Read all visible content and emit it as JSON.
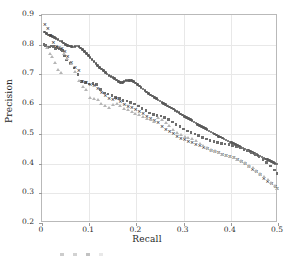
{
  "chart_data": {
    "type": "scatter",
    "title": "",
    "xlabel": "Recall",
    "ylabel": "Precision",
    "xlim": [
      0,
      0.5
    ],
    "ylim": [
      0.2,
      0.9
    ],
    "grid": true,
    "legend_position": "bottom",
    "xticks": [
      "0",
      "0.1",
      "0.2",
      "0.3",
      "0.4",
      "0.5"
    ],
    "xtick_values": [
      0,
      0.1,
      0.2,
      0.3,
      0.4,
      0.5
    ],
    "yticks": [
      "0.2",
      "0.3",
      "0.4",
      "0.5",
      "0.6",
      "0.7",
      "0.8",
      "0.9"
    ],
    "ytick_values": [
      0.2,
      0.3,
      0.4,
      0.5,
      0.6,
      0.7,
      0.8,
      0.9
    ],
    "series": [
      {
        "name": "series-1-dark-line",
        "marker": "circle",
        "color": "#595959",
        "size": 2.6,
        "x": [
          0.005,
          0.01,
          0.014,
          0.018,
          0.022,
          0.026,
          0.03,
          0.034,
          0.038,
          0.042,
          0.046,
          0.05,
          0.054,
          0.058,
          0.062,
          0.066,
          0.07,
          0.074,
          0.078,
          0.082,
          0.086,
          0.09,
          0.094,
          0.098,
          0.102,
          0.106,
          0.11,
          0.114,
          0.118,
          0.122,
          0.126,
          0.13,
          0.134,
          0.138,
          0.142,
          0.146,
          0.15,
          0.154,
          0.158,
          0.162,
          0.166,
          0.17,
          0.174,
          0.178,
          0.182,
          0.186,
          0.19,
          0.194,
          0.198,
          0.202,
          0.206,
          0.21,
          0.214,
          0.218,
          0.222,
          0.226,
          0.23,
          0.234,
          0.238,
          0.242,
          0.246,
          0.25,
          0.254,
          0.258,
          0.262,
          0.266,
          0.27,
          0.274,
          0.278,
          0.282,
          0.286,
          0.29,
          0.294,
          0.298,
          0.302,
          0.306,
          0.31,
          0.314,
          0.318,
          0.322,
          0.326,
          0.33,
          0.334,
          0.338,
          0.342,
          0.346,
          0.35,
          0.354,
          0.358,
          0.362,
          0.366,
          0.37,
          0.374,
          0.378,
          0.382,
          0.386,
          0.39,
          0.394,
          0.398,
          0.402,
          0.406,
          0.41,
          0.414,
          0.418,
          0.422,
          0.426,
          0.43,
          0.434,
          0.438,
          0.442,
          0.446,
          0.45,
          0.454,
          0.458,
          0.462,
          0.466,
          0.47,
          0.474,
          0.478,
          0.482,
          0.486,
          0.49,
          0.494,
          0.498
        ],
        "y": [
          0.843,
          0.838,
          0.833,
          0.831,
          0.828,
          0.824,
          0.82,
          0.818,
          0.813,
          0.81,
          0.806,
          0.801,
          0.797,
          0.795,
          0.793,
          0.792,
          0.794,
          0.796,
          0.793,
          0.789,
          0.783,
          0.777,
          0.77,
          0.763,
          0.757,
          0.751,
          0.744,
          0.737,
          0.73,
          0.724,
          0.718,
          0.713,
          0.707,
          0.702,
          0.697,
          0.693,
          0.69,
          0.687,
          0.681,
          0.676,
          0.672,
          0.673,
          0.676,
          0.679,
          0.68,
          0.68,
          0.679,
          0.676,
          0.671,
          0.666,
          0.661,
          0.656,
          0.651,
          0.646,
          0.641,
          0.636,
          0.631,
          0.627,
          0.623,
          0.619,
          0.614,
          0.61,
          0.606,
          0.602,
          0.598,
          0.594,
          0.59,
          0.587,
          0.583,
          0.579,
          0.575,
          0.571,
          0.567,
          0.563,
          0.559,
          0.555,
          0.551,
          0.548,
          0.544,
          0.54,
          0.536,
          0.532,
          0.529,
          0.525,
          0.521,
          0.518,
          0.514,
          0.51,
          0.506,
          0.503,
          0.499,
          0.496,
          0.492,
          0.489,
          0.486,
          0.482,
          0.479,
          0.476,
          0.473,
          0.47,
          0.467,
          0.464,
          0.461,
          0.458,
          0.455,
          0.452,
          0.449,
          0.446,
          0.443,
          0.44,
          0.437,
          0.434,
          0.431,
          0.428,
          0.425,
          0.422,
          0.419,
          0.416,
          0.413,
          0.41,
          0.407,
          0.404,
          0.401,
          0.398
        ]
      },
      {
        "name": "series-2-squares",
        "marker": "square",
        "color": "#6e6e6e",
        "size": 2.6,
        "x": [
          0.004,
          0.008,
          0.012,
          0.016,
          0.02,
          0.024,
          0.028,
          0.032,
          0.036,
          0.04,
          0.044,
          0.048,
          0.052,
          0.06,
          0.068,
          0.076,
          0.084,
          0.092,
          0.1,
          0.108,
          0.116,
          0.124,
          0.132,
          0.14,
          0.148,
          0.156,
          0.164,
          0.172,
          0.18,
          0.188,
          0.196,
          0.204,
          0.212,
          0.22,
          0.228,
          0.236,
          0.244,
          0.252,
          0.26,
          0.268,
          0.276,
          0.284,
          0.292,
          0.3,
          0.308,
          0.316,
          0.324,
          0.332,
          0.34,
          0.348,
          0.356,
          0.364,
          0.372,
          0.38,
          0.388,
          0.396,
          0.404,
          0.412,
          0.42,
          0.428,
          0.436,
          0.444,
          0.452,
          0.46,
          0.468,
          0.476,
          0.484,
          0.492,
          0.498
        ],
        "y": [
          0.8,
          0.798,
          0.79,
          0.792,
          0.795,
          0.793,
          0.788,
          0.79,
          0.786,
          0.783,
          0.78,
          0.762,
          0.748,
          0.736,
          0.722,
          0.7,
          0.676,
          0.672,
          0.668,
          0.67,
          0.666,
          0.65,
          0.638,
          0.634,
          0.63,
          0.622,
          0.618,
          0.612,
          0.61,
          0.606,
          0.6,
          0.594,
          0.586,
          0.578,
          0.57,
          0.566,
          0.562,
          0.56,
          0.556,
          0.548,
          0.54,
          0.532,
          0.524,
          0.516,
          0.51,
          0.504,
          0.5,
          0.494,
          0.488,
          0.482,
          0.478,
          0.474,
          0.47,
          0.468,
          0.466,
          0.464,
          0.46,
          0.456,
          0.452,
          0.448,
          0.442,
          0.436,
          0.43,
          0.422,
          0.414,
          0.404,
          0.392,
          0.378,
          0.366
        ]
      },
      {
        "name": "series-3-crosses",
        "marker": "x",
        "color": "#3a3a3a",
        "size": 3.0,
        "x": [
          0.006,
          0.012,
          0.018,
          0.024,
          0.03,
          0.036,
          0.042,
          0.048,
          0.054,
          0.062,
          0.07,
          0.078,
          0.086,
          0.094,
          0.102,
          0.11,
          0.118,
          0.126,
          0.134,
          0.142,
          0.15,
          0.158,
          0.166,
          0.174,
          0.182,
          0.19,
          0.198,
          0.206,
          0.214,
          0.222,
          0.23,
          0.238,
          0.246,
          0.254,
          0.262,
          0.27,
          0.278,
          0.286,
          0.294,
          0.302,
          0.31,
          0.318,
          0.326,
          0.334,
          0.342,
          0.35,
          0.358,
          0.366,
          0.374,
          0.382,
          0.39,
          0.398,
          0.406,
          0.414,
          0.422,
          0.43,
          0.438,
          0.446,
          0.454,
          0.462,
          0.47,
          0.478,
          0.486,
          0.494,
          0.498
        ],
        "y": [
          0.868,
          0.855,
          0.83,
          0.808,
          0.796,
          0.79,
          0.786,
          0.778,
          0.762,
          0.74,
          0.724,
          0.712,
          0.678,
          0.674,
          0.668,
          0.662,
          0.652,
          0.64,
          0.628,
          0.62,
          0.616,
          0.618,
          0.61,
          0.6,
          0.592,
          0.588,
          0.582,
          0.576,
          0.568,
          0.56,
          0.552,
          0.546,
          0.538,
          0.524,
          0.514,
          0.508,
          0.5,
          0.492,
          0.486,
          0.48,
          0.474,
          0.47,
          0.466,
          0.462,
          0.456,
          0.45,
          0.444,
          0.44,
          0.436,
          0.432,
          0.428,
          0.424,
          0.42,
          0.414,
          0.408,
          0.4,
          0.392,
          0.382,
          0.372,
          0.362,
          0.35,
          0.34,
          0.332,
          0.324,
          0.318
        ]
      },
      {
        "name": "series-4-light-triangles",
        "marker": "triangle",
        "color": "#b5b5b5",
        "size": 2.4,
        "x": [
          0.01,
          0.016,
          0.022,
          0.028,
          0.034,
          0.04,
          0.046,
          0.054,
          0.062,
          0.07,
          0.078,
          0.086,
          0.094,
          0.102,
          0.11,
          0.118,
          0.126,
          0.134,
          0.142,
          0.15,
          0.158,
          0.166,
          0.174,
          0.182,
          0.19,
          0.198,
          0.206,
          0.214,
          0.222,
          0.23,
          0.238,
          0.246,
          0.254,
          0.262,
          0.27,
          0.278,
          0.286,
          0.294,
          0.302,
          0.31,
          0.318,
          0.326,
          0.334,
          0.342,
          0.35,
          0.358,
          0.366,
          0.374,
          0.382,
          0.39,
          0.398,
          0.406,
          0.414,
          0.422,
          0.43,
          0.438,
          0.446,
          0.454,
          0.462,
          0.47,
          0.478,
          0.486,
          0.494,
          0.498
        ],
        "y": [
          0.79,
          0.772,
          0.76,
          0.742,
          0.716,
          0.706,
          0.77,
          0.756,
          0.738,
          0.712,
          0.68,
          0.66,
          0.65,
          0.622,
          0.62,
          0.618,
          0.604,
          0.596,
          0.59,
          0.6,
          0.604,
          0.596,
          0.588,
          0.582,
          0.576,
          0.57,
          0.566,
          0.56,
          0.554,
          0.548,
          0.542,
          0.556,
          0.548,
          0.54,
          0.528,
          0.516,
          0.506,
          0.498,
          0.492,
          0.488,
          0.486,
          0.478,
          0.47,
          0.462,
          0.456,
          0.45,
          0.444,
          0.438,
          0.432,
          0.428,
          0.424,
          0.42,
          0.416,
          0.41,
          0.404,
          0.396,
          0.388,
          0.378,
          0.368,
          0.358,
          0.348,
          0.338,
          0.328,
          0.316
        ]
      }
    ]
  },
  "legend": {
    "visible": true,
    "cropped": true,
    "items": [
      {
        "label": ""
      },
      {
        "label": ""
      },
      {
        "label": ""
      },
      {
        "label": ""
      }
    ]
  }
}
